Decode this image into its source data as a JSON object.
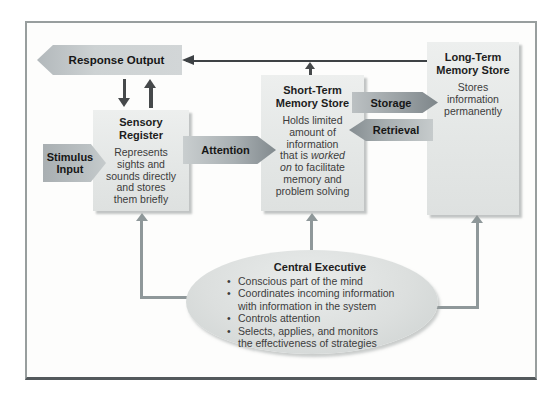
{
  "response_output": {
    "label": "Response Output"
  },
  "stimulus_input": {
    "label": "Stimulus\nInput"
  },
  "attention": {
    "label": "Attention"
  },
  "storage": {
    "label": "Storage"
  },
  "retrieval": {
    "label": "Retrieval"
  },
  "sensory_register": {
    "title": "Sensory\nRegister",
    "body": "Represents\nsights and\nsounds directly\nand stores\nthem briefly"
  },
  "short_term": {
    "title": "Short-Term\nMemory Store",
    "body_rich": [
      {
        "text": "Holds limited\namount of\ninformation\nthat is "
      },
      {
        "text": "worked\non",
        "italic": true
      },
      {
        "text": " to facilitate\nmemory and\nproblem solving"
      }
    ]
  },
  "long_term": {
    "title": "Long-Term\nMemory Store",
    "body": "Stores\ninformation\npermanently"
  },
  "central_executive": {
    "title": "Central Executive",
    "bullets": [
      "Conscious part of the mind",
      "Coordinates incoming information\nwith information in the system",
      "Controls attention",
      "Selects, applies, and monitors\nthe effectiveness of strategies"
    ]
  },
  "colors": {
    "box_fill": "#e6e9e8",
    "dark_arrow": "#3e4245",
    "gray_connector": "#8f989a",
    "frame_border": "#989e9e",
    "frame_bottom": "#53595c"
  }
}
